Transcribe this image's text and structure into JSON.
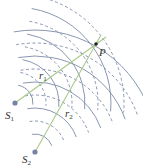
{
  "diagram": {
    "colors": {
      "wave_arc": "#7d8aa8",
      "path_line": "#a9c98a",
      "source_dot": "#7882a6",
      "point_dot": "#222222",
      "text": "#333333"
    },
    "sources": [
      {
        "id": "S1",
        "label": "S",
        "subscript": "1",
        "x": 15,
        "y": 103,
        "label_x": 5,
        "label_y": 119
      },
      {
        "id": "S2",
        "label": "S",
        "subscript": "2",
        "x": 35,
        "y": 152,
        "label_x": 22,
        "label_y": 163
      }
    ],
    "point": {
      "label": "P",
      "x": 96,
      "y": 44,
      "label_x": 99,
      "label_y": 56
    },
    "paths": [
      {
        "label": "r",
        "subscript": "1",
        "from": "S1",
        "label_x": 39,
        "label_y": 79,
        "end_x": 106,
        "end_y": 37
      },
      {
        "label": "r",
        "subscript": "2",
        "from": "S2",
        "label_x": 65,
        "label_y": 117,
        "end_x": 101,
        "end_y": 35
      }
    ],
    "wavefronts": {
      "S1": {
        "radii": [
          18,
          31,
          44,
          57,
          70,
          83,
          96,
          109
        ],
        "start_angle": -80,
        "end_angle": 5
      },
      "S2": {
        "radii": [
          18,
          31,
          44,
          57,
          70,
          83,
          96,
          109,
          122
        ],
        "start_angle": -100,
        "end_angle": -20
      },
      "legend": {
        "solid": "crest",
        "dashed": "trough"
      }
    }
  }
}
